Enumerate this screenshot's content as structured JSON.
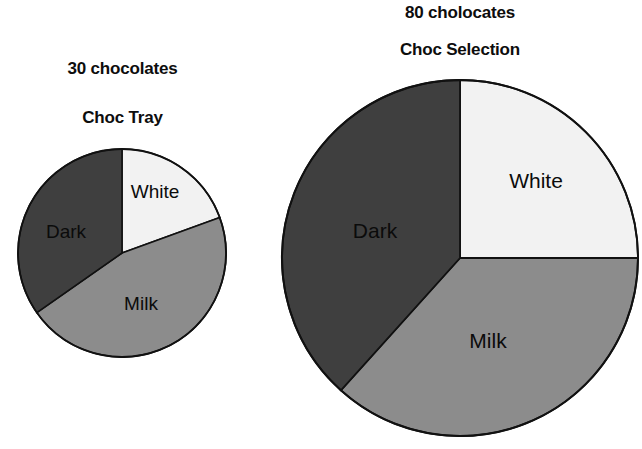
{
  "figure": {
    "background": "#ffffff",
    "outline_color": "#111111"
  },
  "palette": {
    "dark": "#3f3f3f",
    "milk": "#8c8c8c",
    "white": "#f2f2f2",
    "label_text": "#0b0b0b",
    "caption_text": "#0d0d0d"
  },
  "small_chart": {
    "count_caption": "30 chocolates",
    "title": "Choc Tray",
    "labels": {
      "white": "White",
      "milk": "Milk",
      "dark": "Dark"
    }
  },
  "large_chart": {
    "count_caption": "80 cholocates",
    "title": "Choc Selection",
    "labels": {
      "white": "White",
      "milk": "Milk",
      "dark": "Dark"
    }
  },
  "chart_data": [
    {
      "type": "pie",
      "title": "Choc Tray",
      "subtitle": "30 chocolates",
      "total": 30,
      "radius_px": 104,
      "start_angle_deg": 0,
      "direction": "clockwise",
      "categories": [
        "White",
        "Milk",
        "Dark"
      ],
      "values": [
        5.8,
        13.75,
        10.45
      ],
      "angles_deg": [
        70,
        165,
        125
      ],
      "percentages": [
        19.4,
        45.8,
        34.7
      ],
      "colors": [
        "#f2f2f2",
        "#8c8c8c",
        "#3f3f3f"
      ],
      "legend": "none",
      "grid": false,
      "labels_inside": true
    },
    {
      "type": "pie",
      "title": "Choc Selection",
      "subtitle": "80 cholocates",
      "total": 80,
      "radius_px": 180,
      "start_angle_deg": 0,
      "direction": "clockwise",
      "categories": [
        "White",
        "Milk",
        "Dark"
      ],
      "values": [
        20,
        29.3,
        30.7
      ],
      "angles_deg": [
        90,
        132,
        138
      ],
      "percentages": [
        25.0,
        36.7,
        38.3
      ],
      "colors": [
        "#f2f2f2",
        "#8c8c8c",
        "#3f3f3f"
      ],
      "legend": "none",
      "grid": false,
      "labels_inside": true
    }
  ]
}
